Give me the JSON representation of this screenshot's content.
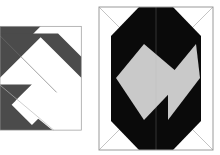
{
  "image": {
    "kind": "geometric-figure-pair",
    "background_color": "#ffffff",
    "width": 220,
    "height": 155,
    "caption": "",
    "figure_count": 2
  },
  "palette": {
    "white": "#ffffff",
    "dark_gray": "#4b4b4b",
    "light_gray": "#c9c9c9",
    "black": "#0a0a0a",
    "frame_line": "#9a9a9a",
    "thin_guide_line": "#b5b5b5"
  },
  "figures": [
    {
      "id": "figure-left",
      "name": "diagonal-band-square",
      "label": "",
      "clipped_at_left_edge": true,
      "frame": {
        "x": -34,
        "y": 7,
        "width": 112,
        "height": 143,
        "stroke": "#9a9a9a",
        "stroke_width": 1,
        "fill": "#ffffff"
      },
      "shapes": [
        {
          "name": "upper-dark-band",
          "fill": "#4b4b4b",
          "points": "-34,7 22,7 -34,63"
        },
        {
          "name": "main-dark-band",
          "fill": "#4b4b4b",
          "points": "-34,17 46,17 78,49 78,78 22,22 -34,78"
        },
        {
          "name": "lower-dark-band",
          "fill": "#4b4b4b",
          "points": "-34,87 10,87 -34,131"
        },
        {
          "name": "lower-dark-wedge",
          "fill": "#4b4b4b",
          "points": "-34,92 38,150 -34,150"
        },
        {
          "name": "white-inner-square",
          "fill": "#ffffff",
          "points": "10,87 38,115 10,143 -18,115"
        }
      ],
      "guide_lines": [
        {
          "name": "band-seam-upper",
          "x1": -34,
          "y1": 20,
          "x2": 44,
          "y2": 98,
          "stroke": "#6e6e6e"
        },
        {
          "name": "band-seam-lower",
          "x1": -34,
          "y1": 88,
          "x2": 40,
          "y2": 150,
          "stroke": "#b5b5b5"
        }
      ]
    },
    {
      "id": "figure-right",
      "name": "octagon-with-gray-diamonds",
      "label": "",
      "clipped_at_left_edge": false,
      "frame": {
        "x": 3,
        "y": 7,
        "width": 114,
        "height": 143,
        "stroke": "#9a9a9a",
        "stroke_width": 1,
        "fill": "#ffffff"
      },
      "shapes": [
        {
          "name": "black-octagon",
          "fill": "#0a0a0a",
          "points": "43,7 77,7 105,36 105,68 105,121 77,150 43,150 15,121 15,68 15,36"
        },
        {
          "name": "left-gray-diamond",
          "fill": "#c9c9c9",
          "points": "20,78 48,44 88,78 48,120"
        },
        {
          "name": "right-gray-diamond",
          "fill": "#c9c9c9",
          "points": "72,78 100,44 104,78 72,120"
        }
      ],
      "corner_guides": [
        {
          "name": "corner-guide-top-left",
          "x1": 3,
          "y1": 7,
          "x2": 30,
          "y2": 34
        },
        {
          "name": "corner-guide-top-right",
          "x1": 117,
          "y1": 7,
          "x2": 90,
          "y2": 34
        },
        {
          "name": "corner-guide-bottom-left",
          "x1": 3,
          "y1": 150,
          "x2": 30,
          "y2": 123
        },
        {
          "name": "corner-guide-bottom-right",
          "x1": 117,
          "y1": 150,
          "x2": 90,
          "y2": 123
        }
      ],
      "center_seam": {
        "name": "vertical-center-seam",
        "x1": 60,
        "y1": 7,
        "x2": 60,
        "y2": 150
      }
    }
  ]
}
